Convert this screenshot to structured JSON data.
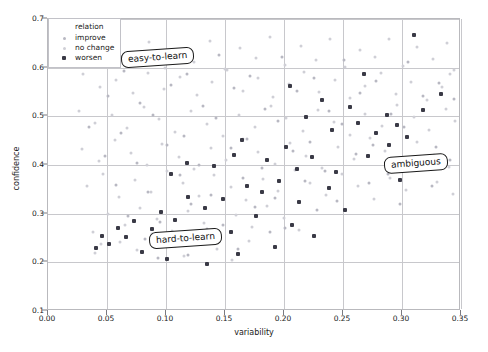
{
  "chart_data": {
    "type": "scatter",
    "title": "",
    "xlabel": "variability",
    "ylabel": "confidence",
    "xlim": [
      0.0,
      0.35
    ],
    "ylim": [
      0.1,
      0.7
    ],
    "grid": true,
    "xticks": [
      "0.00",
      "0.05",
      "0.10",
      "0.15",
      "0.20",
      "0.25",
      "0.30",
      "0.35"
    ],
    "xtick_values": [
      0.0,
      0.05,
      0.1,
      0.15,
      0.2,
      0.25,
      0.3,
      0.35
    ],
    "yticks": [
      "0.1",
      "0.2",
      "0.3",
      "0.4",
      "0.5",
      "0.6",
      "0.7"
    ],
    "ytick_values": [
      0.1,
      0.2,
      0.3,
      0.4,
      0.5,
      0.6,
      0.7
    ],
    "legend": {
      "title": "relation",
      "position": "upper-left",
      "entries": [
        {
          "label": "improve",
          "marker": "dot",
          "color": "#b8b8c2"
        },
        {
          "label": "no change",
          "marker": "dot",
          "color": "#cfcfd6"
        },
        {
          "label": "worsen",
          "marker": "square",
          "color": "#3a3a46"
        }
      ]
    },
    "annotations": [
      {
        "text": "easy-to-learn",
        "x": 0.073,
        "y": 0.607
      },
      {
        "text": "hard-to-learn",
        "x": 0.098,
        "y": 0.236
      },
      {
        "text": "ambiguous",
        "x": 0.295,
        "y": 0.383
      }
    ],
    "series": [
      {
        "name": "no change",
        "color": "#cfcfd6",
        "points": [
          [
            0.021,
            0.672
          ],
          [
            0.034,
            0.641
          ],
          [
            0.047,
            0.629
          ],
          [
            0.059,
            0.661
          ],
          [
            0.071,
            0.617
          ],
          [
            0.086,
            0.652
          ],
          [
            0.099,
            0.6
          ],
          [
            0.11,
            0.634
          ],
          [
            0.124,
            0.612
          ],
          [
            0.137,
            0.655
          ],
          [
            0.15,
            0.598
          ],
          [
            0.163,
            0.64
          ],
          [
            0.176,
            0.62
          ],
          [
            0.188,
            0.663
          ],
          [
            0.201,
            0.606
          ],
          [
            0.214,
            0.644
          ],
          [
            0.227,
            0.615
          ],
          [
            0.239,
            0.658
          ],
          [
            0.252,
            0.602
          ],
          [
            0.264,
            0.637
          ],
          [
            0.277,
            0.621
          ],
          [
            0.289,
            0.659
          ],
          [
            0.301,
            0.604
          ],
          [
            0.313,
            0.643
          ],
          [
            0.326,
            0.618
          ],
          [
            0.338,
            0.65
          ],
          [
            0.344,
            0.596
          ],
          [
            0.03,
            0.586
          ],
          [
            0.044,
            0.561
          ],
          [
            0.058,
            0.575
          ],
          [
            0.072,
            0.548
          ],
          [
            0.085,
            0.59
          ],
          [
            0.098,
            0.556
          ],
          [
            0.112,
            0.581
          ],
          [
            0.126,
            0.544
          ],
          [
            0.139,
            0.57
          ],
          [
            0.152,
            0.595
          ],
          [
            0.165,
            0.552
          ],
          [
            0.178,
            0.578
          ],
          [
            0.191,
            0.54
          ],
          [
            0.204,
            0.566
          ],
          [
            0.217,
            0.592
          ],
          [
            0.23,
            0.549
          ],
          [
            0.243,
            0.574
          ],
          [
            0.256,
            0.537
          ],
          [
            0.269,
            0.563
          ],
          [
            0.282,
            0.589
          ],
          [
            0.295,
            0.546
          ],
          [
            0.308,
            0.571
          ],
          [
            0.321,
            0.534
          ],
          [
            0.334,
            0.56
          ],
          [
            0.341,
            0.586
          ],
          [
            0.026,
            0.511
          ],
          [
            0.04,
            0.487
          ],
          [
            0.054,
            0.502
          ],
          [
            0.067,
            0.476
          ],
          [
            0.081,
            0.519
          ],
          [
            0.094,
            0.494
          ],
          [
            0.108,
            0.468
          ],
          [
            0.121,
            0.51
          ],
          [
            0.135,
            0.485
          ],
          [
            0.148,
            0.46
          ],
          [
            0.162,
            0.503
          ],
          [
            0.175,
            0.478
          ],
          [
            0.189,
            0.521
          ],
          [
            0.202,
            0.496
          ],
          [
            0.216,
            0.47
          ],
          [
            0.229,
            0.513
          ],
          [
            0.242,
            0.488
          ],
          [
            0.256,
            0.462
          ],
          [
            0.269,
            0.505
          ],
          [
            0.283,
            0.48
          ],
          [
            0.296,
            0.523
          ],
          [
            0.31,
            0.498
          ],
          [
            0.323,
            0.472
          ],
          [
            0.337,
            0.515
          ],
          [
            0.345,
            0.49
          ],
          [
            0.029,
            0.432
          ],
          [
            0.043,
            0.409
          ],
          [
            0.057,
            0.451
          ],
          [
            0.07,
            0.425
          ],
          [
            0.084,
            0.4
          ],
          [
            0.097,
            0.443
          ],
          [
            0.111,
            0.417
          ],
          [
            0.124,
            0.392
          ],
          [
            0.138,
            0.435
          ],
          [
            0.151,
            0.41
          ],
          [
            0.165,
            0.453
          ],
          [
            0.178,
            0.427
          ],
          [
            0.192,
            0.402
          ],
          [
            0.205,
            0.445
          ],
          [
            0.219,
            0.419
          ],
          [
            0.232,
            0.394
          ],
          [
            0.246,
            0.437
          ],
          [
            0.259,
            0.412
          ],
          [
            0.273,
            0.455
          ],
          [
            0.286,
            0.429
          ],
          [
            0.3,
            0.404
          ],
          [
            0.313,
            0.447
          ],
          [
            0.327,
            0.421
          ],
          [
            0.34,
            0.396
          ],
          [
            0.033,
            0.356
          ],
          [
            0.047,
            0.381
          ],
          [
            0.06,
            0.334
          ],
          [
            0.074,
            0.37
          ],
          [
            0.087,
            0.345
          ],
          [
            0.101,
            0.388
          ],
          [
            0.114,
            0.362
          ],
          [
            0.128,
            0.337
          ],
          [
            0.141,
            0.379
          ],
          [
            0.155,
            0.354
          ],
          [
            0.168,
            0.329
          ],
          [
            0.182,
            0.372
          ],
          [
            0.195,
            0.347
          ],
          [
            0.209,
            0.39
          ],
          [
            0.222,
            0.364
          ],
          [
            0.236,
            0.339
          ],
          [
            0.249,
            0.382
          ],
          [
            0.263,
            0.356
          ],
          [
            0.276,
            0.331
          ],
          [
            0.29,
            0.374
          ],
          [
            0.303,
            0.349
          ],
          [
            0.317,
            0.392
          ],
          [
            0.33,
            0.366
          ],
          [
            0.343,
            0.341
          ],
          [
            0.051,
            0.299
          ],
          [
            0.065,
            0.277
          ],
          [
            0.078,
            0.312
          ],
          [
            0.092,
            0.289
          ],
          [
            0.105,
            0.264
          ],
          [
            0.119,
            0.305
          ],
          [
            0.132,
            0.281
          ],
          [
            0.146,
            0.256
          ],
          [
            0.159,
            0.297
          ],
          [
            0.173,
            0.273
          ],
          [
            0.186,
            0.315
          ],
          [
            0.2,
            0.291
          ],
          [
            0.213,
            0.266
          ],
          [
            0.061,
            0.241
          ],
          [
            0.075,
            0.225
          ],
          [
            0.088,
            0.258
          ],
          [
            0.102,
            0.233
          ],
          [
            0.115,
            0.212
          ],
          [
            0.129,
            0.25
          ],
          [
            0.143,
            0.228
          ],
          [
            0.156,
            0.205
          ],
          [
            0.17,
            0.244
          ],
          [
            0.038,
            0.262
          ],
          [
            0.045,
            0.238
          ],
          [
            0.04,
            0.219
          ]
        ]
      },
      {
        "name": "improve",
        "color": "#b8b8c2",
        "points": [
          [
            0.038,
            0.655
          ],
          [
            0.064,
            0.594
          ],
          [
            0.091,
            0.631
          ],
          [
            0.118,
            0.588
          ],
          [
            0.145,
            0.626
          ],
          [
            0.171,
            0.583
          ],
          [
            0.198,
            0.621
          ],
          [
            0.225,
            0.578
          ],
          [
            0.251,
            0.616
          ],
          [
            0.278,
            0.573
          ],
          [
            0.305,
            0.611
          ],
          [
            0.331,
            0.568
          ],
          [
            0.051,
            0.541
          ],
          [
            0.078,
            0.528
          ],
          [
            0.104,
            0.565
          ],
          [
            0.131,
            0.522
          ],
          [
            0.158,
            0.559
          ],
          [
            0.184,
            0.516
          ],
          [
            0.211,
            0.553
          ],
          [
            0.238,
            0.51
          ],
          [
            0.264,
            0.547
          ],
          [
            0.291,
            0.504
          ],
          [
            0.318,
            0.541
          ],
          [
            0.344,
            0.535
          ],
          [
            0.035,
            0.479
          ],
          [
            0.062,
            0.466
          ],
          [
            0.089,
            0.503
          ],
          [
            0.115,
            0.46
          ],
          [
            0.142,
            0.497
          ],
          [
            0.169,
            0.454
          ],
          [
            0.195,
            0.491
          ],
          [
            0.222,
            0.448
          ],
          [
            0.249,
            0.485
          ],
          [
            0.275,
            0.442
          ],
          [
            0.302,
            0.479
          ],
          [
            0.329,
            0.436
          ],
          [
            0.048,
            0.418
          ],
          [
            0.075,
            0.405
          ],
          [
            0.101,
            0.441
          ],
          [
            0.128,
            0.399
          ],
          [
            0.155,
            0.435
          ],
          [
            0.181,
            0.393
          ],
          [
            0.208,
            0.429
          ],
          [
            0.235,
            0.387
          ],
          [
            0.261,
            0.423
          ],
          [
            0.288,
            0.381
          ],
          [
            0.315,
            0.417
          ],
          [
            0.341,
            0.411
          ],
          [
            0.058,
            0.358
          ],
          [
            0.085,
            0.344
          ],
          [
            0.112,
            0.38
          ],
          [
            0.138,
            0.338
          ],
          [
            0.165,
            0.374
          ],
          [
            0.192,
            0.332
          ],
          [
            0.218,
            0.368
          ],
          [
            0.245,
            0.326
          ],
          [
            0.272,
            0.362
          ],
          [
            0.298,
            0.32
          ],
          [
            0.325,
            0.356
          ],
          [
            0.068,
            0.296
          ],
          [
            0.095,
            0.283
          ],
          [
            0.121,
            0.319
          ],
          [
            0.148,
            0.277
          ],
          [
            0.175,
            0.313
          ],
          [
            0.201,
            0.271
          ],
          [
            0.228,
            0.307
          ],
          [
            0.082,
            0.247
          ],
          [
            0.108,
            0.234
          ],
          [
            0.135,
            0.269
          ],
          [
            0.161,
            0.228
          ],
          [
            0.188,
            0.263
          ],
          [
            0.093,
            0.208
          ],
          [
            0.119,
            0.215
          ]
        ]
      },
      {
        "name": "worsen",
        "color": "#3a3a46",
        "points": [
          [
            0.31,
            0.668
          ],
          [
            0.268,
            0.588
          ],
          [
            0.205,
            0.563
          ],
          [
            0.232,
            0.534
          ],
          [
            0.256,
            0.52
          ],
          [
            0.287,
            0.502
          ],
          [
            0.263,
            0.486
          ],
          [
            0.241,
            0.471
          ],
          [
            0.219,
            0.498
          ],
          [
            0.278,
            0.466
          ],
          [
            0.296,
            0.483
          ],
          [
            0.164,
            0.452
          ],
          [
            0.158,
            0.421
          ],
          [
            0.141,
            0.398
          ],
          [
            0.118,
            0.404
          ],
          [
            0.104,
            0.382
          ],
          [
            0.202,
            0.438
          ],
          [
            0.186,
            0.41
          ],
          [
            0.211,
            0.392
          ],
          [
            0.224,
            0.416
          ],
          [
            0.196,
            0.368
          ],
          [
            0.181,
            0.345
          ],
          [
            0.169,
            0.357
          ],
          [
            0.148,
            0.33
          ],
          [
            0.133,
            0.312
          ],
          [
            0.119,
            0.335
          ],
          [
            0.108,
            0.288
          ],
          [
            0.096,
            0.304
          ],
          [
            0.088,
            0.268
          ],
          [
            0.073,
            0.284
          ],
          [
            0.066,
            0.252
          ],
          [
            0.059,
            0.271
          ],
          [
            0.052,
            0.238
          ],
          [
            0.046,
            0.255
          ],
          [
            0.041,
            0.23
          ],
          [
            0.08,
            0.221
          ],
          [
            0.101,
            0.206
          ],
          [
            0.127,
            0.24
          ],
          [
            0.155,
            0.262
          ],
          [
            0.176,
            0.296
          ],
          [
            0.213,
            0.324
          ],
          [
            0.238,
            0.352
          ],
          [
            0.252,
            0.308
          ],
          [
            0.289,
            0.441
          ],
          [
            0.304,
            0.458
          ],
          [
            0.271,
            0.419
          ],
          [
            0.244,
            0.386
          ],
          [
            0.318,
            0.512
          ],
          [
            0.333,
            0.546
          ],
          [
            0.207,
            0.276
          ],
          [
            0.161,
            0.218
          ],
          [
            0.135,
            0.196
          ],
          [
            0.225,
            0.255
          ],
          [
            0.192,
            0.232
          ],
          [
            0.298,
            0.37
          ]
        ]
      }
    ]
  }
}
